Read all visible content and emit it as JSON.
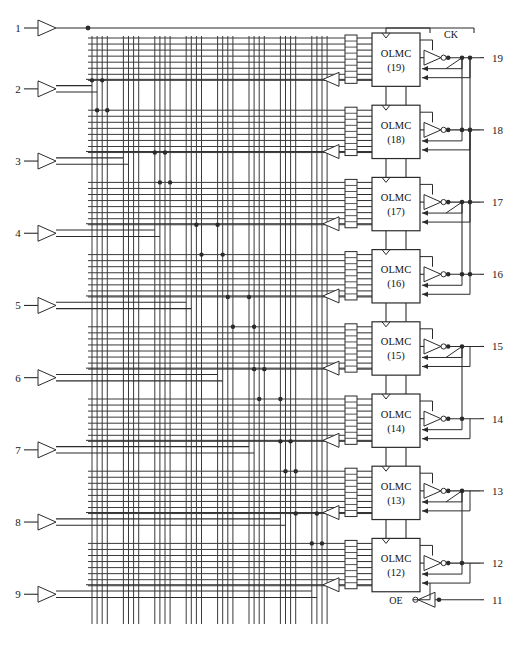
{
  "diagram": {
    "device_family": "GAL/PAL",
    "array_type": "programmable-AND-array",
    "signals": {
      "clock_label": "CK",
      "output_enable_label": "OE",
      "olmc_prefix": "OLMC"
    },
    "input_pins": [
      {
        "number": "1",
        "buffer": "single",
        "role": "clock"
      },
      {
        "number": "2",
        "buffer": "dual",
        "role": "input"
      },
      {
        "number": "3",
        "buffer": "dual",
        "role": "input"
      },
      {
        "number": "4",
        "buffer": "dual",
        "role": "input"
      },
      {
        "number": "5",
        "buffer": "dual",
        "role": "input"
      },
      {
        "number": "6",
        "buffer": "dual",
        "role": "input"
      },
      {
        "number": "7",
        "buffer": "dual",
        "role": "input"
      },
      {
        "number": "8",
        "buffer": "dual",
        "role": "input"
      },
      {
        "number": "9",
        "buffer": "dual",
        "role": "input"
      }
    ],
    "olmc_blocks": [
      {
        "name": "OLMC",
        "number": "(19)",
        "pin": "19",
        "product_terms": 8
      },
      {
        "name": "OLMC",
        "number": "(18)",
        "pin": "18",
        "product_terms": 8
      },
      {
        "name": "OLMC",
        "number": "(17)",
        "pin": "17",
        "product_terms": 8
      },
      {
        "name": "OLMC",
        "number": "(16)",
        "pin": "16",
        "product_terms": 8
      },
      {
        "name": "OLMC",
        "number": "(15)",
        "pin": "15",
        "product_terms": 8
      },
      {
        "name": "OLMC",
        "number": "(14)",
        "pin": "14",
        "product_terms": 8
      },
      {
        "name": "OLMC",
        "number": "(13)",
        "pin": "13",
        "product_terms": 8
      },
      {
        "name": "OLMC",
        "number": "(12)",
        "pin": "12",
        "product_terms": 8
      }
    ],
    "output_pins": [
      {
        "number": "19"
      },
      {
        "number": "18"
      },
      {
        "number": "17"
      },
      {
        "number": "16"
      },
      {
        "number": "15"
      },
      {
        "number": "14"
      },
      {
        "number": "13"
      },
      {
        "number": "12"
      },
      {
        "number": "11",
        "role": "output-enable"
      }
    ],
    "array": {
      "column_groups": 8,
      "columns_per_group": 4,
      "total_columns": 32,
      "rows_per_block": 8,
      "total_rows": 64
    },
    "fuse_dots": [
      {
        "col": 0,
        "row_block": 0,
        "row": 7
      },
      {
        "col": 2,
        "row_block": 0,
        "row": 7
      },
      {
        "col": 1,
        "row_block": 1,
        "row": 0
      },
      {
        "col": 3,
        "row_block": 1,
        "row": 0
      },
      {
        "col": 8,
        "row_block": 1,
        "row": 7
      },
      {
        "col": 10,
        "row_block": 1,
        "row": 7
      },
      {
        "col": 9,
        "row_block": 2,
        "row": 0
      },
      {
        "col": 11,
        "row_block": 2,
        "row": 0
      },
      {
        "col": 14,
        "row_block": 2,
        "row": 7
      },
      {
        "col": 16,
        "row_block": 2,
        "row": 7
      },
      {
        "col": 15,
        "row_block": 3,
        "row": 0
      },
      {
        "col": 17,
        "row_block": 3,
        "row": 0
      },
      {
        "col": 18,
        "row_block": 3,
        "row": 7
      },
      {
        "col": 20,
        "row_block": 3,
        "row": 7
      },
      {
        "col": 19,
        "row_block": 4,
        "row": 0
      },
      {
        "col": 21,
        "row_block": 4,
        "row": 0
      },
      {
        "col": 21,
        "row_block": 4,
        "row": 7
      },
      {
        "col": 23,
        "row_block": 4,
        "row": 7
      },
      {
        "col": 22,
        "row_block": 5,
        "row": 0
      },
      {
        "col": 24,
        "row_block": 5,
        "row": 0
      },
      {
        "col": 24,
        "row_block": 5,
        "row": 7
      },
      {
        "col": 26,
        "row_block": 5,
        "row": 7
      },
      {
        "col": 25,
        "row_block": 6,
        "row": 0
      },
      {
        "col": 27,
        "row_block": 6,
        "row": 0
      },
      {
        "col": 27,
        "row_block": 6,
        "row": 7
      },
      {
        "col": 29,
        "row_block": 6,
        "row": 7
      },
      {
        "col": 28,
        "row_block": 7,
        "row": 0
      },
      {
        "col": 30,
        "row_block": 7,
        "row": 0
      }
    ],
    "colors": {
      "line": "#2b2b2b",
      "array_line": "#3a3a3a",
      "background": "#ffffff",
      "text": "#111111"
    },
    "caption": ""
  }
}
